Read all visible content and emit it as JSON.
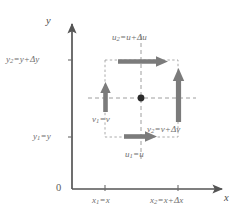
{
  "diagram": {
    "type": "coordinate-diagram",
    "colors": {
      "axis": "#555555",
      "arrow": "#7b7b7b",
      "dashed": "#9a9a9a",
      "text": "#6e6e6e",
      "dot": "#2b2b2b",
      "background": "#ffffff"
    },
    "axes": {
      "x_label": "x",
      "y_label": "y",
      "origin_label": "0"
    },
    "y_ticks": [
      {
        "id": "y2",
        "label": "y₂=y+Δy",
        "label_html": "y<sub>2</sub>=y+<span class=\"delta\">Δ</span>y",
        "value_px": 60
      },
      {
        "id": "y1",
        "label": "y₁=y",
        "label_html": "y<sub>1</sub>=y",
        "value_px": 137
      }
    ],
    "x_ticks": [
      {
        "id": "x1",
        "label": "x₁=x",
        "label_html": "x<sub>1</sub>=x",
        "value_px": 105
      },
      {
        "id": "x2",
        "label": "x₂=x+Δx",
        "label_html": "x<sub>2</sub>=x+<span class=\"delta\">Δ</span>x",
        "value_px": 178
      }
    ],
    "flux_labels": [
      {
        "id": "u2",
        "label": "u₂=u+Δu",
        "label_html": "u<sub>2</sub>=u+<span class=\"delta\">Δ</span>u",
        "position": "top"
      },
      {
        "id": "u1",
        "label": "u₁=u",
        "label_html": "u<sub>1</sub>=u",
        "position": "bottom"
      },
      {
        "id": "v1",
        "label": "v₁=v",
        "label_html": "v<sub>1</sub>=v",
        "position": "left"
      },
      {
        "id": "v2",
        "label": "v₂=v+Δv",
        "label_html": "v<sub>2</sub>=v+<span class=\"delta\">Δ</span>v",
        "position": "right"
      }
    ],
    "arrows": [
      {
        "id": "arrow-u2",
        "direction": "right",
        "length": "long",
        "at": "top-edge"
      },
      {
        "id": "arrow-u1",
        "direction": "right",
        "length": "short",
        "at": "bottom-edge"
      },
      {
        "id": "arrow-v1",
        "direction": "up",
        "length": "short",
        "at": "left-edge"
      },
      {
        "id": "arrow-v2",
        "direction": "up",
        "length": "long",
        "at": "right-edge"
      }
    ],
    "center_point": {
      "id": "element-center",
      "x_px": 141,
      "y_px": 98
    }
  }
}
